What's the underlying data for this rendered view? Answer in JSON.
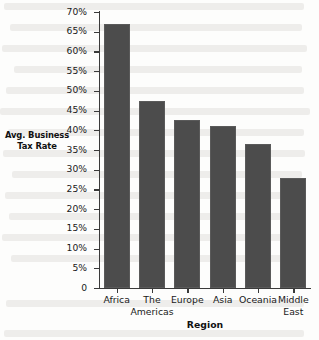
{
  "chart_data": {
    "type": "bar",
    "title": "",
    "xlabel": "Region",
    "ylabel": "Avg. Business Tax Rate",
    "categories": [
      "Africa",
      "The Americas",
      "Europe",
      "Asia",
      "Oceania",
      "Middle East"
    ],
    "values": [
      67,
      47.5,
      42.5,
      41,
      36.5,
      27.8
    ],
    "value_unit": "%",
    "ylim": [
      0,
      70
    ],
    "ytick_values": [
      0,
      5,
      10,
      15,
      20,
      25,
      30,
      35,
      40,
      45,
      50,
      55,
      60,
      65,
      70
    ],
    "ytick_labels": [
      "0",
      "5%",
      "10%",
      "15%",
      "20%",
      "25%",
      "30%",
      "35%",
      "40%",
      "45%",
      "50%",
      "55%",
      "60%",
      "65%",
      "70%"
    ],
    "grid": false,
    "legend": null,
    "bar_color": "#4c4c4c",
    "axis_color": "#3a3a3a",
    "background_color": "#fdfdfc"
  }
}
